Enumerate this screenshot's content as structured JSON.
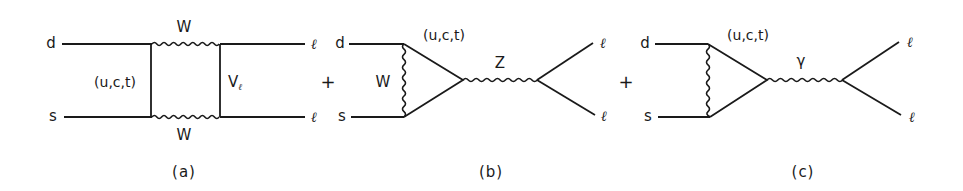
{
  "figure": {
    "panels": [
      {
        "id": "a",
        "caption": "(a)",
        "type": "box-diagram",
        "incoming": {
          "top": "d",
          "bottom": "s"
        },
        "outgoing": {
          "top": "ℓ",
          "bottom": "ℓ"
        },
        "internal_quark_label": "(u,c,t)",
        "boson_top": "W",
        "boson_bottom": "W",
        "neutrino_label": "V",
        "neutrino_sub": "ℓ"
      },
      {
        "id": "b",
        "caption": "(b)",
        "type": "penguin-diagram",
        "incoming": {
          "top": "d",
          "bottom": "s"
        },
        "outgoing": {
          "top": "ℓ",
          "bottom": "ℓ"
        },
        "loop_boson": "W",
        "internal_quark_label": "(u,c,t)",
        "exchanged_boson": "Z"
      },
      {
        "id": "c",
        "caption": "(c)",
        "type": "penguin-diagram",
        "incoming": {
          "top": "d",
          "bottom": "s"
        },
        "outgoing": {
          "top": "ℓ",
          "bottom": "ℓ"
        },
        "internal_quark_label": "(u,c,t)",
        "exchanged_boson": "γ"
      }
    ],
    "operators": [
      "+",
      "+"
    ]
  }
}
